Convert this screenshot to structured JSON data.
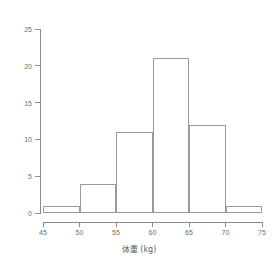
{
  "chart_data": {
    "type": "bar",
    "title": "",
    "subtitle": "",
    "xlabel": "体重 (kg)",
    "ylabel": "",
    "xlim": [
      45,
      75
    ],
    "ylim": [
      0,
      25
    ],
    "grid": false,
    "legend": false,
    "bin_width": 5,
    "bin_edges": [
      45,
      50,
      55,
      60,
      65,
      70,
      75
    ],
    "categories": [
      "45-50",
      "50-55",
      "55-60",
      "60-65",
      "65-70",
      "70-75"
    ],
    "values": [
      1,
      4,
      11,
      21,
      12,
      1
    ],
    "bars": [
      {
        "label": "45-50",
        "start": 45,
        "end": 50,
        "value": 1
      },
      {
        "label": "50-55",
        "start": 50,
        "end": 55,
        "value": 4
      },
      {
        "label": "55-60",
        "start": 55,
        "end": 60,
        "value": 11
      },
      {
        "label": "60-65",
        "start": 60,
        "end": 65,
        "value": 21
      },
      {
        "label": "65-70",
        "start": 65,
        "end": 70,
        "value": 12
      },
      {
        "label": "70-75",
        "start": 70,
        "end": 75,
        "value": 1
      }
    ],
    "x_ticks": [
      45,
      50,
      55,
      60,
      65,
      70,
      75
    ],
    "x_tick_labels": [
      "45",
      "50",
      "55",
      "60",
      "65",
      "70",
      "75"
    ],
    "y_ticks": [
      0,
      5,
      10,
      15,
      20,
      25
    ],
    "y_tick_labels": [
      "0",
      "5",
      "10",
      "15",
      "20",
      "25"
    ],
    "colors": {
      "bar_fill": "#ffffff",
      "bar_stroke": "#9a9a9a",
      "axis": "#8c8c8c",
      "text": "#6e6e6e",
      "background": "#ffffff"
    }
  }
}
